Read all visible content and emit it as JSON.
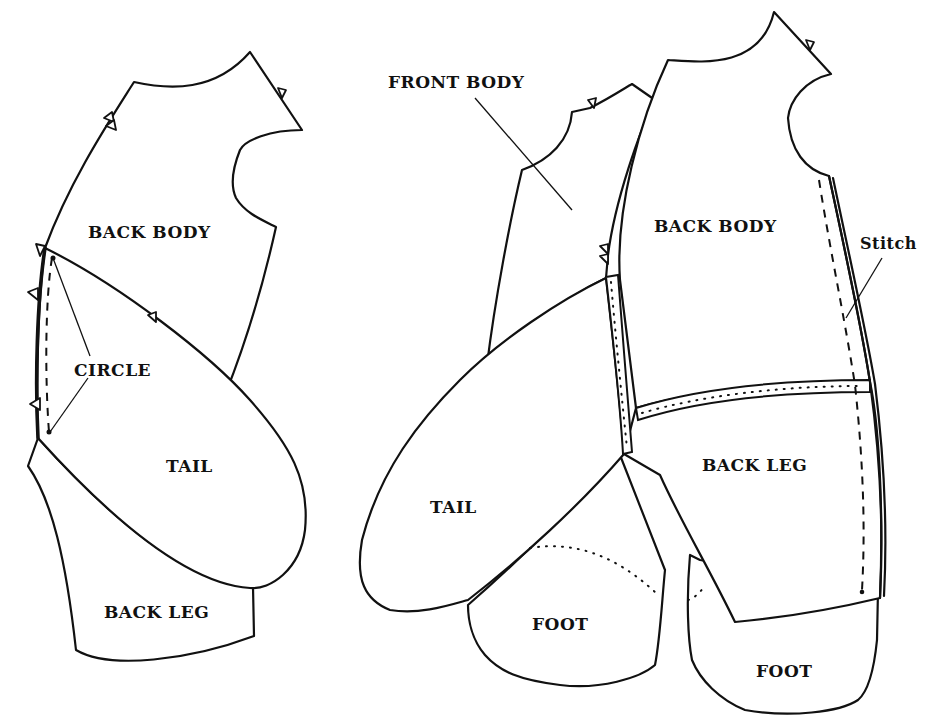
{
  "diagram": {
    "type": "sewing-pattern-assembly",
    "colors": {
      "ink": "#111111",
      "paper": "#ffffff"
    },
    "left_figure": {
      "labels": {
        "back_body": "BACK BODY",
        "circle": "CIRCLE",
        "tail": "TAIL",
        "back_leg": "BACK LEG"
      }
    },
    "right_figure": {
      "labels": {
        "front_body": "FRONT BODY",
        "back_body": "BACK BODY",
        "stitch": "Stitch",
        "tail": "TAIL",
        "back_leg": "BACK LEG",
        "foot_left": "FOOT",
        "foot_right": "FOOT"
      }
    }
  }
}
